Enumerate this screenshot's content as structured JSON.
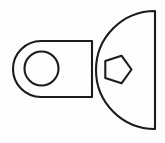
{
  "figure": {
    "title": "Mechanical part outline drawing",
    "background_color": "#fdfdfd",
    "stroke_color": "#1b1b1b",
    "fill_color": "#fdfdfd",
    "stroke_width": 2.1,
    "canvas": {
      "width": 165,
      "height": 143
    },
    "shapes": [
      {
        "name": "mounting-lug-outline",
        "type": "rounded-tab",
        "role": "outline",
        "left_end_cap_center": [
          41,
          69
        ],
        "left_end_cap_radius": 28,
        "top_edge_y": 41,
        "bottom_edge_y": 97,
        "right_x": 92,
        "path": "M 92 41 L 41 41 A 28 28 0 0 0 41 97 L 92 97 Z"
      },
      {
        "name": "lug-through-hole",
        "type": "circle",
        "role": "hole",
        "center": [
          41.5,
          68.5
        ],
        "radius": 17.0
      },
      {
        "name": "d-body-outline",
        "type": "semicircle-d-shape",
        "role": "outline",
        "arc_center": [
          155,
          70
        ],
        "arc_radius": 59,
        "flat_edge_x": 155,
        "flat_edge_top_y": 11,
        "flat_edge_bottom_y": 129,
        "path": "M 155 11 A 59 59 0 0 0 155 129 Z"
      },
      {
        "name": "pentagon-through-hole",
        "type": "pentagon",
        "role": "hole",
        "center": [
          117,
          69.5
        ],
        "circumradius": 14.5,
        "rotation_degrees": 0,
        "vertex_orientation": "point-right",
        "vertices": [
          [
            131.5,
            69.5
          ],
          [
            121.5,
            83.3
          ],
          [
            105.3,
            78.0
          ],
          [
            105.3,
            61.0
          ],
          [
            121.5,
            55.7
          ]
        ]
      }
    ]
  }
}
